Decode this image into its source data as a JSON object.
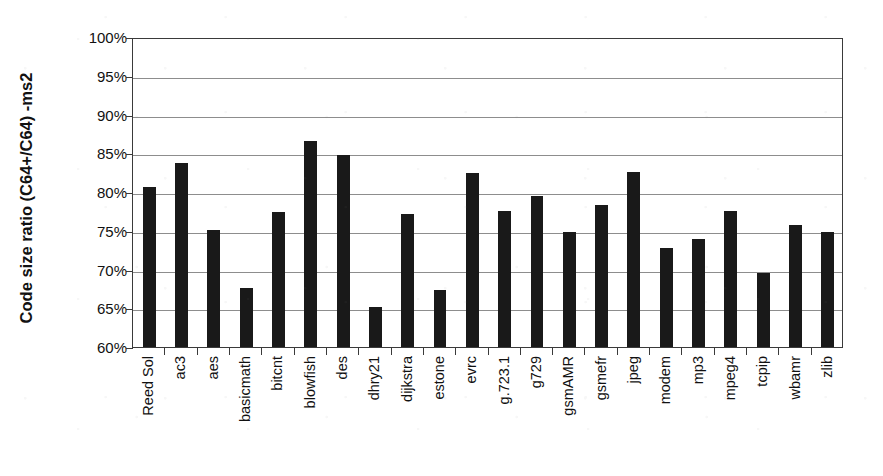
{
  "chart_data": {
    "type": "bar",
    "title": "",
    "xlabel": "",
    "ylabel": "Code size ratio (C64+/C64) -ms2",
    "ylim": [
      60,
      100
    ],
    "ytick_step": 5,
    "ytick_labels": [
      "100%",
      "95%",
      "90%",
      "85%",
      "80%",
      "75%",
      "70%",
      "65%",
      "60%"
    ],
    "ytick_values": [
      100,
      95,
      90,
      85,
      80,
      75,
      70,
      65,
      60
    ],
    "grid": true,
    "legend": "none",
    "bar_color": "#191919",
    "gridline_color": "#8d8d8d",
    "axis_color": "#3a3a3a",
    "categories": [
      "Reed Sol",
      "ac3",
      "aes",
      "basicmath",
      "bitcnt",
      "blowfish",
      "des",
      "dhry21",
      "dijkstra",
      "estone",
      "evrc",
      "g.723.1",
      "g729",
      "gsmAMR",
      "gsmefr",
      "jpeg",
      "modem",
      "mp3",
      "mpeg4",
      "tcpip",
      "wbamr",
      "zlib"
    ],
    "values": [
      80.6,
      83.8,
      75.1,
      67.6,
      77.4,
      86.6,
      84.8,
      65.2,
      77.1,
      67.3,
      82.4,
      77.6,
      79.5,
      74.9,
      78.3,
      82.6,
      72.8,
      74.0,
      77.5,
      69.6,
      75.8,
      74.8
    ],
    "value_unit": "%"
  }
}
